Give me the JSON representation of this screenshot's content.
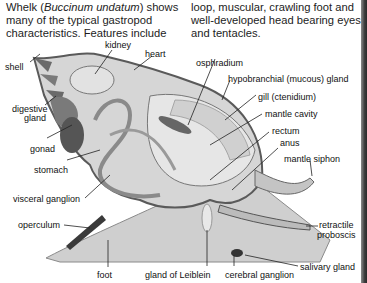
{
  "intro": {
    "left_prefix": "Whelk (",
    "left_species": "Buccinum undatum",
    "left_suffix": ") shows many of the typical gastropod characteristics. Features include",
    "right": "loop, muscular, crawling foot and well-developed head bearing eyes and tentacles."
  },
  "labels": {
    "kidney": "kidney",
    "heart": "heart",
    "shell": "shell",
    "osphradium": "osphradium",
    "hypobranchial_gland": "hypobranchial (mucous) gland",
    "gill": "gill (ctenidium)",
    "digestive_gland_1": "digestive",
    "digestive_gland_2": "gland",
    "mantle_cavity": "mantle cavity",
    "rectum": "rectum",
    "gonad": "gonad",
    "anus": "anus",
    "stomach": "stomach",
    "mantle_siphon": "mantle siphon",
    "visceral_ganglion": "visceral ganglion",
    "operculum": "operculum",
    "retractile_proboscis_1": "retractile",
    "retractile_proboscis_2": "proboscis",
    "salivary_gland": "salivary gland",
    "foot": "foot",
    "gland_of_leiblein": "gland of Leiblein",
    "cerebral_ganglion": "cerebral ganglion"
  },
  "colors": {
    "shell_light": "#dcdcdc",
    "shell_dark": "#6e6e6e",
    "body": "#c8c8c8",
    "outline": "#555555",
    "organ_dark": "#4a4a4a"
  }
}
